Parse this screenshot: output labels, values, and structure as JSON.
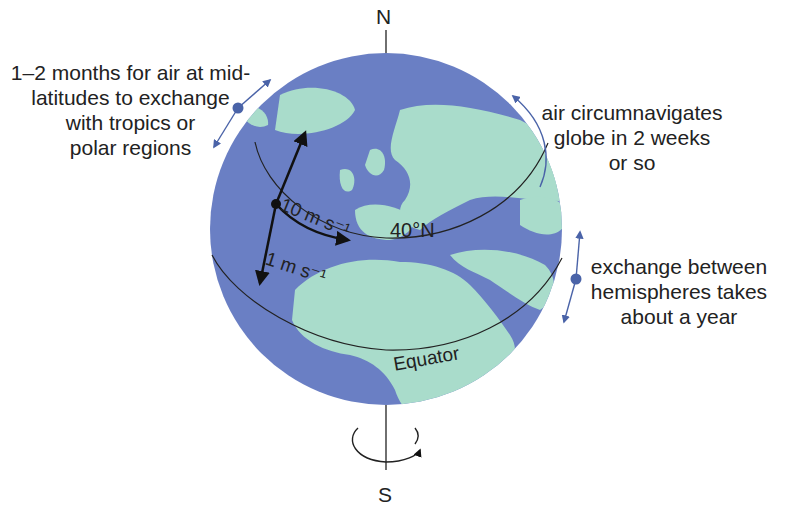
{
  "labels": {
    "north": "N",
    "south": "S",
    "lat40": "40°N",
    "equator": "Equator",
    "wind_zonal": "10 m s⁻¹",
    "wind_meridional": "1 m s⁻¹"
  },
  "annotations": {
    "midlat": [
      "1–2 months for air at mid-",
      "latitudes to exchange",
      "with tropics or",
      "polar regions"
    ],
    "circ": [
      "air circumnavigates",
      "globe in 2 weeks",
      "or so"
    ],
    "hemi": [
      "exchange between",
      "hemispheres takes",
      "about a year"
    ]
  },
  "colors": {
    "ocean": "#6a7fc4",
    "land": "#a9dccb",
    "arrow_blue": "#4a63a8",
    "ink": "#1a1a1a"
  }
}
